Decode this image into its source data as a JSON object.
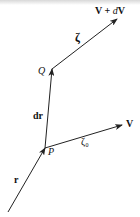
{
  "diagram": {
    "labels": {
      "v_plus_dv": "V + dV",
      "v_plus_dv_parts": {
        "bold1": "V",
        "plus": " + ",
        "d": "d",
        "bold2": "V"
      },
      "zeta": "ζ",
      "q": "Q",
      "dr": "dr",
      "p": "P",
      "zeta0": "ζ₀",
      "v": "V",
      "r": "r"
    },
    "vectors": [
      {
        "name": "r",
        "from": "origin",
        "to": "P"
      },
      {
        "name": "dr",
        "from": "P",
        "to": "Q"
      },
      {
        "name": "zeta",
        "from": "Q",
        "to": "V + dV"
      },
      {
        "name": "zeta0",
        "from": "P",
        "to": "V"
      }
    ],
    "colors": {
      "stroke": "#222222",
      "text": "#111111"
    }
  }
}
